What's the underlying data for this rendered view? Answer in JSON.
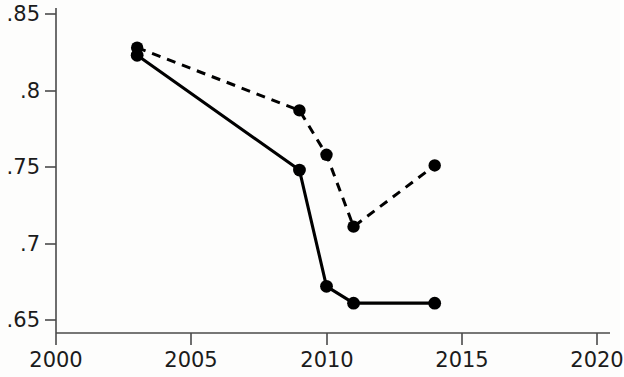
{
  "chart_data": {
    "type": "line",
    "title": "",
    "subtitle": "",
    "xlabel": "",
    "ylabel": "",
    "xlim": [
      2000,
      2020
    ],
    "ylim": [
      0.65,
      0.85
    ],
    "grid": false,
    "legend": "none",
    "x_ticks": [
      2000,
      2005,
      2010,
      2015,
      2020
    ],
    "x_tick_labels": [
      "2000",
      "2005",
      "2010",
      "2015",
      "2020"
    ],
    "y_ticks": [
      0.65,
      0.7,
      0.75,
      0.8,
      0.85
    ],
    "y_tick_labels": [
      ".65",
      ".7",
      ".75",
      ".8",
      ".85"
    ],
    "series": [
      {
        "name": "solid-series",
        "style": "solid",
        "marker": "filled-circle",
        "x": [
          2003,
          2009,
          2010,
          2011,
          2014
        ],
        "values": [
          0.823,
          0.748,
          0.672,
          0.661,
          0.661
        ]
      },
      {
        "name": "dashed-series",
        "style": "dashed",
        "marker": "filled-circle",
        "x": [
          2003,
          2009,
          2010,
          2011,
          2014
        ],
        "values": [
          0.828,
          0.787,
          0.758,
          0.711,
          0.751
        ]
      }
    ],
    "colors": {
      "solid_series": "#000000",
      "dashed_series": "#000000",
      "axis": "#4a4a4a",
      "background": "#fdfdfc",
      "text": "#1b1b1b"
    }
  }
}
